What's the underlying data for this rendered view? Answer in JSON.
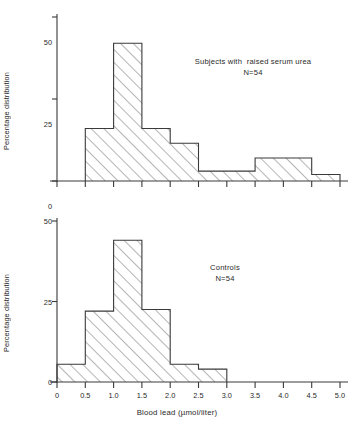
{
  "figure": {
    "xlabel": "Blood lead (µmol/liter)",
    "ylabel_top": "Percentage distribution",
    "ylabel_bottom": "Percentage distribution"
  },
  "chart_data": [
    {
      "type": "bar",
      "title": "Subjects with  raised serum urea",
      "subtitle": "N=54",
      "xlabel": "Blood lead (µmol/liter)",
      "ylabel": "Percentage distribution",
      "xlim": [
        0,
        5.25
      ],
      "ylim": [
        0,
        50
      ],
      "yticks": [
        0,
        25,
        50
      ],
      "ytick_labels": [
        "0",
        "25",
        "50"
      ],
      "xticks": [
        0,
        0.5,
        1.0,
        1.5,
        2.0,
        2.5,
        3.0,
        3.5,
        4.0,
        4.5,
        5.0
      ],
      "xtick_labels": [
        "0",
        "0.5",
        "1.0",
        "1.5",
        "2.0",
        "2.5",
        "3.0",
        "3.5",
        "4.0",
        "4.5",
        "5.0"
      ],
      "grid": false,
      "legend": "none",
      "bin_width": 0.5,
      "bin_edges": [
        0.5,
        1.0,
        1.5,
        2.0,
        2.5,
        3.0,
        3.5,
        4.0,
        4.5,
        5.0
      ],
      "categories": [
        "0.5-1.0",
        "1.0-1.5",
        "1.5-2.0",
        "2.0-2.5",
        "2.5-3.0",
        "3.0-3.5",
        "3.5-4.0",
        "4.0-4.5",
        "4.5-5.0"
      ],
      "values": [
        16,
        42,
        16,
        11.5,
        3,
        3,
        7,
        7,
        2
      ]
    },
    {
      "type": "bar",
      "title": "Controls",
      "subtitle": "N=54",
      "xlabel": "Blood lead (µmol/liter)",
      "ylabel": "Percentage distribution",
      "xlim": [
        0,
        5.25
      ],
      "ylim": [
        0,
        50
      ],
      "yticks": [
        0,
        25,
        50
      ],
      "ytick_labels": [
        "0",
        "25",
        "50"
      ],
      "xticks": [
        0,
        0.5,
        1.0,
        1.5,
        2.0,
        2.5,
        3.0,
        3.5,
        4.0,
        4.5,
        5.0
      ],
      "xtick_labels": [
        "0",
        "0.5",
        "1.0",
        "1.5",
        "2.0",
        "2.5",
        "3.0",
        "3.5",
        "4.0",
        "4.5",
        "5.0"
      ],
      "grid": false,
      "legend": "none",
      "bin_width": 0.5,
      "bin_edges": [
        0,
        0.5,
        1.0,
        1.5,
        2.0,
        2.5,
        3.0
      ],
      "categories": [
        "0-0.5",
        "0.5-1.0",
        "1.0-1.5",
        "1.5-2.0",
        "2.0-2.5",
        "2.5-3.0"
      ],
      "values": [
        5.5,
        22,
        44,
        22.5,
        5.5,
        4
      ]
    }
  ],
  "annotations": {
    "top_line1": "Subjects with  raised serum urea",
    "top_line2": "N=54",
    "bottom_line1": "Controls",
    "bottom_line2": "N=54"
  },
  "style": {
    "ink": "#3a3a3a",
    "text": "#2a2a2a",
    "background": "#ffffff"
  }
}
